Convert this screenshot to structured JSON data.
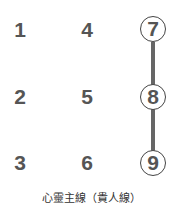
{
  "diagram": {
    "title": "心靈主線（貴人線）",
    "cells": [
      {
        "value": "1",
        "circled": false
      },
      {
        "value": "2",
        "circled": false
      },
      {
        "value": "3",
        "circled": false
      },
      {
        "value": "4",
        "circled": false
      },
      {
        "value": "5",
        "circled": false
      },
      {
        "value": "6",
        "circled": false
      },
      {
        "value": "7",
        "circled": true
      },
      {
        "value": "8",
        "circled": true
      },
      {
        "value": "9",
        "circled": true
      }
    ],
    "line": {
      "connects": [
        "7",
        "8",
        "9"
      ],
      "color": "#666666"
    }
  }
}
